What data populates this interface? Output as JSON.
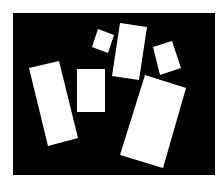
{
  "canvas": {
    "width": 224,
    "height": 184,
    "page_background": "#ffffff",
    "frame": {
      "x": 13,
      "y": 13,
      "width": 202,
      "height": 162,
      "fill": "#000000"
    }
  },
  "shapes": [
    {
      "name": "left-tall-rectangle",
      "fill": "#ffffff",
      "points": "29,68 59,61 78,138 48,146"
    },
    {
      "name": "middle-rectangle",
      "fill": "#ffffff",
      "points": "77,69 105,69 105,112 77,112"
    },
    {
      "name": "small-tilted-square-left",
      "fill": "#ffffff",
      "points": "98,29 114,35 108,53 92,47"
    },
    {
      "name": "top-tall-rectangle",
      "fill": "#ffffff",
      "points": "120,23 147,27 139,80 112,76"
    },
    {
      "name": "small-tilted-square-right",
      "fill": "#ffffff",
      "points": "153,47 172,41 181,68 160,75"
    },
    {
      "name": "large-tilted-rectangle",
      "fill": "#ffffff",
      "points": "145,75 186,88 163,168 120,155"
    }
  ]
}
